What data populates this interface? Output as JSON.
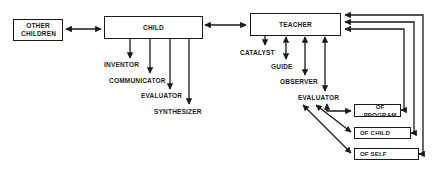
{
  "diagram": {
    "nodes": {
      "other_children": "OTHER CHILDREN",
      "child": "CHILD",
      "teacher": "TEACHER",
      "of_program": "OF PROGRAM",
      "of_child": "OF CHILD",
      "of_self": "OF SELF"
    },
    "child_roles": [
      "INVENTOR",
      "COMMUNICATOR",
      "EVALUATOR",
      "SYNTHESIZER"
    ],
    "teacher_roles": [
      "CATALYST",
      "GUIDE",
      "OBSERVER",
      "EVALUATOR"
    ],
    "edges": [
      {
        "from": "OTHER CHILDREN",
        "to": "CHILD",
        "type": "bidirectional"
      },
      {
        "from": "CHILD",
        "to": "TEACHER",
        "type": "bidirectional"
      },
      {
        "from": "CHILD",
        "to": "INVENTOR",
        "type": "directed"
      },
      {
        "from": "CHILD",
        "to": "COMMUNICATOR",
        "type": "directed"
      },
      {
        "from": "CHILD",
        "to": "EVALUATOR",
        "type": "directed"
      },
      {
        "from": "CHILD",
        "to": "SYNTHESIZER",
        "type": "directed"
      },
      {
        "from": "TEACHER",
        "to": "CATALYST",
        "type": "directed"
      },
      {
        "from": "TEACHER",
        "to": "GUIDE",
        "type": "bidirectional"
      },
      {
        "from": "TEACHER",
        "to": "OBSERVER",
        "type": "bidirectional"
      },
      {
        "from": "TEACHER",
        "to": "EVALUATOR",
        "type": "bidirectional"
      },
      {
        "from": "EVALUATOR",
        "to": "OF PROGRAM",
        "type": "bidirectional"
      },
      {
        "from": "EVALUATOR",
        "to": "OF CHILD",
        "type": "bidirectional"
      },
      {
        "from": "EVALUATOR",
        "to": "OF SELF",
        "type": "bidirectional"
      },
      {
        "from": "OF PROGRAM",
        "to": "TEACHER",
        "type": "feedback"
      },
      {
        "from": "OF CHILD",
        "to": "TEACHER",
        "type": "feedback"
      },
      {
        "from": "OF SELF",
        "to": "TEACHER",
        "type": "feedback"
      }
    ]
  }
}
